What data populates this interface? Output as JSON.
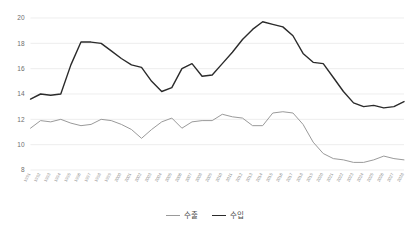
{
  "chart_data": {
    "type": "line",
    "title": "",
    "xlabel": "",
    "ylabel": "",
    "ylim": [
      8,
      20
    ],
    "yticks": [
      8,
      10,
      12,
      14,
      16,
      18,
      20
    ],
    "grid": true,
    "legend_position": "bottom-center",
    "categories": [
      "1991",
      "1992",
      "1993",
      "1994",
      "1995",
      "1996",
      "1997",
      "1998",
      "1999",
      "2000",
      "2001",
      "2002",
      "2003",
      "2004",
      "2005",
      "2006",
      "2007",
      "2008",
      "2009",
      "2010",
      "2011",
      "2012",
      "2013",
      "2014",
      "2015",
      "2016",
      "2017",
      "2018",
      "2019",
      "2020",
      "2021",
      "2022",
      "2023",
      "2024",
      "2025",
      "2026",
      "2027",
      "2028"
    ],
    "series": [
      {
        "name": "수출",
        "color": "#9a9a9a",
        "values": [
          11.3,
          11.9,
          11.8,
          12.0,
          11.7,
          11.5,
          11.6,
          12.0,
          11.9,
          11.6,
          11.2,
          10.5,
          11.2,
          11.8,
          12.1,
          11.3,
          11.8,
          11.9,
          11.9,
          12.4,
          12.2,
          12.1,
          11.5,
          11.5,
          12.5,
          12.6,
          12.5,
          11.6,
          10.2,
          9.3,
          8.9,
          8.8,
          8.6,
          8.6,
          8.8,
          9.1,
          8.9,
          8.8
        ]
      },
      {
        "name": "수입",
        "color": "#2b2b2b",
        "values": [
          13.6,
          14.0,
          13.9,
          14.0,
          16.3,
          18.1,
          18.1,
          18.0,
          17.4,
          16.8,
          16.3,
          16.1,
          15.0,
          14.2,
          14.5,
          16.0,
          16.4,
          15.4,
          15.5,
          16.4,
          17.3,
          18.3,
          19.1,
          19.7,
          19.5,
          19.3,
          18.6,
          17.2,
          16.5,
          16.4,
          15.3,
          14.2,
          13.3,
          13.0,
          13.1,
          12.9,
          13.0,
          13.4
        ]
      }
    ]
  },
  "legend": {
    "items": [
      {
        "label": "수출",
        "color": "#9a9a9a"
      },
      {
        "label": "수입",
        "color": "#2b2b2b"
      }
    ]
  }
}
